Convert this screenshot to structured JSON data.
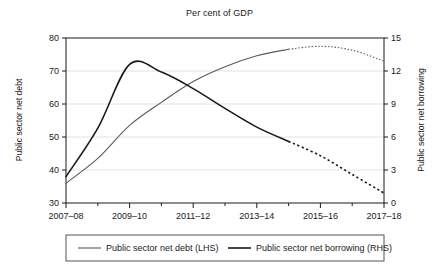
{
  "chart_data": {
    "type": "line",
    "title": "Per cent of GDP",
    "xlabel": "",
    "ylabel": "Public sector net debt",
    "y2label": "Public sector net borrowing",
    "grid": true,
    "legend_position": "bottom",
    "x": [
      "2007-08",
      "2008-09",
      "2009-10",
      "2010-11",
      "2011-12",
      "2012-13",
      "2013-14",
      "2014-15",
      "2015-16",
      "2016-17",
      "2017-18"
    ],
    "x_tick_labels": [
      "2007–08",
      "2009–10",
      "2011–12",
      "2013–14",
      "2015–16",
      "2017–18"
    ],
    "x_tick_positions": [
      0,
      2,
      4,
      6,
      8,
      10
    ],
    "ylim": [
      30,
      80
    ],
    "y_ticks": [
      30,
      40,
      50,
      60,
      70,
      80
    ],
    "y2lim": [
      0,
      15
    ],
    "y2_ticks": [
      0,
      3,
      6,
      9,
      12,
      15
    ],
    "forecast_start_index": 7,
    "series": [
      {
        "name": "Public sector net debt (LHS)",
        "axis": "left",
        "color": "#5a5a5a",
        "width": 1.1,
        "values": [
          36.0,
          43.5,
          53.5,
          60.5,
          66.8,
          71.3,
          74.6,
          76.6,
          77.5,
          76.3,
          73.0
        ],
        "actual_values": [
          36.0,
          43.5,
          53.5,
          60.5,
          66.8,
          71.3,
          74.6,
          77.5
        ],
        "forecast_values": [
          77.5,
          77.5,
          76.3,
          73.0
        ]
      },
      {
        "name": "Public sector net borrowing (RHS)",
        "axis": "right",
        "color": "#1a1a1a",
        "width": 1.6,
        "values": [
          2.4,
          6.8,
          12.6,
          11.9,
          10.4,
          8.6,
          6.9,
          5.6,
          4.3,
          2.6,
          0.9
        ],
        "actual_values": [
          2.4,
          6.8,
          12.6,
          11.9,
          10.4,
          8.6,
          6.9,
          5.6,
          4.3
        ],
        "forecast_values": [
          4.3,
          2.6,
          0.9
        ]
      }
    ],
    "legend": [
      {
        "label": "Public sector net debt (LHS)",
        "color": "#5a5a5a",
        "width": 1.1
      },
      {
        "label": "Public sector net borrowing (RHS)",
        "color": "#1a1a1a",
        "width": 1.6
      }
    ]
  },
  "colors": {
    "background": "#ffffff",
    "axis": "#1a1a1a",
    "grid": "#e2e2e2",
    "debt_line": "#5a5a5a",
    "borrowing_line": "#1a1a1a",
    "legend_border": "#555555"
  }
}
